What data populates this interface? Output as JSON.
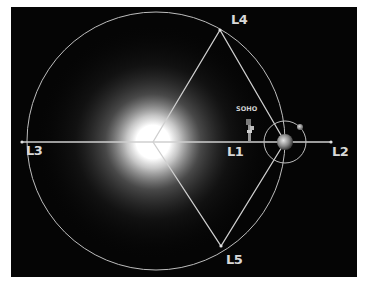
{
  "diagram": {
    "labels": {
      "l1": "L1",
      "l2": "L2",
      "l3": "L3",
      "l4": "L4",
      "l5": "L5",
      "spacecraft": "SOHO"
    },
    "bodies": [
      "Sun",
      "Earth",
      "Moon",
      "SOHO spacecraft"
    ],
    "colors": {
      "background": "#050505",
      "lines": "#cfcfcf",
      "labels": "#d8d8d8",
      "border": "#ffffff"
    }
  }
}
